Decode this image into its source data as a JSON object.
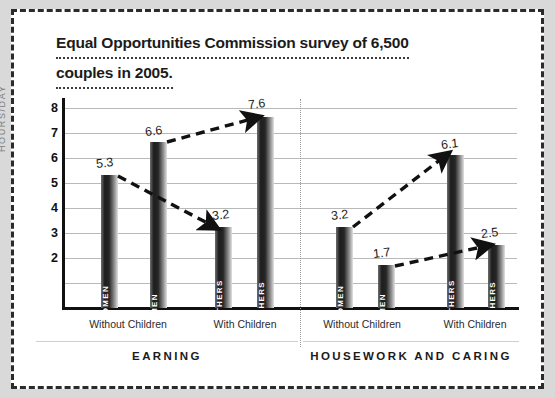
{
  "chart_data": {
    "type": "bar",
    "title": "Equal Opportunities Commission survey of 6,500 couples in 2005.",
    "title_lines": [
      "Equal Opportunities Commission survey of 6,500",
      "couples in 2005."
    ],
    "ylabel": "HOURS/DAY",
    "xlabel": "",
    "ylim": [
      0,
      8
    ],
    "yticks": [
      "8",
      "7",
      "6",
      "5",
      "4",
      "3",
      "2"
    ],
    "ytick_values": [
      8,
      7,
      6,
      5,
      4,
      3,
      2
    ],
    "grid": true,
    "legend": "none",
    "panels": [
      {
        "name": "EARNING",
        "categories": [
          "Without Children",
          "With Children"
        ],
        "bars": [
          {
            "label": "WOMEN",
            "value": 5.3,
            "value_text": "5.3",
            "group": "Without Children"
          },
          {
            "label": "MEN",
            "value": 6.6,
            "value_text": "6.6",
            "group": "Without Children"
          },
          {
            "label": "MOTHERS",
            "value": 3.2,
            "value_text": "3.2",
            "group": "With Children"
          },
          {
            "label": "FATHERS",
            "value": 7.6,
            "value_text": "7.6",
            "group": "With Children"
          }
        ],
        "arrows": [
          {
            "from": "WOMEN",
            "to": "MOTHERS",
            "direction": "down"
          },
          {
            "from": "MEN",
            "to": "FATHERS",
            "direction": "up"
          }
        ]
      },
      {
        "name": "HOUSEWORK AND CARING",
        "categories": [
          "Without Children",
          "With Children"
        ],
        "bars": [
          {
            "label": "WOMEN",
            "value": 3.2,
            "value_text": "3.2",
            "group": "Without Children"
          },
          {
            "label": "MEN",
            "value": 1.7,
            "value_text": "1.7",
            "group": "Without Children"
          },
          {
            "label": "MOTHERS",
            "value": 6.1,
            "value_text": "6.1",
            "group": "With Children"
          },
          {
            "label": "FATHERS",
            "value": 2.5,
            "value_text": "2.5",
            "group": "With Children"
          }
        ],
        "arrows": [
          {
            "from": "WOMEN",
            "to": "MOTHERS",
            "direction": "up"
          },
          {
            "from": "MEN",
            "to": "FATHERS",
            "direction": "up"
          }
        ]
      }
    ],
    "colors": {
      "bar_dark": "#1d1d1d",
      "bar_light": "#e2e2e2",
      "axis": "#111111",
      "grid": "#b9b9b9",
      "card_background": "#ffffff",
      "page_background": "#d9d9d9",
      "border": "#2b2b2b",
      "axis_label": "#7b7b7b"
    }
  },
  "panel_labels": {
    "earning": "EARNING",
    "housework": "HOUSEWORK AND CARING"
  },
  "xcats": {
    "l1": "Without Children",
    "l2": "With Children",
    "r1": "Without Children",
    "r2": "With Children"
  },
  "yticks": {
    "t8": "8",
    "t7": "7",
    "t6": "6",
    "t5": "5",
    "t4": "4",
    "t3": "3",
    "t2": "2"
  },
  "bars": {
    "e1": {
      "label": "WOMEN",
      "value": "5.3"
    },
    "e2": {
      "label": "MEN",
      "value": "6.6"
    },
    "e3": {
      "label": "MOTHERS",
      "value": "3.2"
    },
    "e4": {
      "label": "FATHERS",
      "value": "7.6"
    },
    "h1": {
      "label": "WOMEN",
      "value": "3.2"
    },
    "h2": {
      "label": "MEN",
      "value": "1.7"
    },
    "h3": {
      "label": "MOTHERS",
      "value": "6.1"
    },
    "h4": {
      "label": "FATHERS",
      "value": "2.5"
    }
  },
  "title": {
    "line1": "Equal Opportunities Commission survey of 6,500",
    "line2": "couples in 2005."
  },
  "ylabel": "HOURS/DAY"
}
